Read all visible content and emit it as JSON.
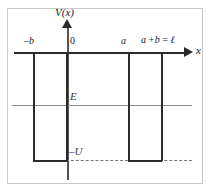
{
  "figure": {
    "axes": {
      "y_label": "V(x)",
      "x_label": "x"
    },
    "tick_labels": {
      "minus_b": "–b",
      "origin": "0",
      "a": "a",
      "period": "a +b = ℓ"
    },
    "levels": {
      "energy_label": "E",
      "depth_label": "–U"
    },
    "colors": {
      "curve": "#2b2b2b",
      "axis": "#2b2b2b",
      "y_axis": "#555555",
      "energy_line": "#8d8d8d",
      "dashed_line": "#777777",
      "frame": "#c9c9c9",
      "background": "#ffffff"
    }
  },
  "chart_data": {
    "type": "line",
    "xlabel": "x",
    "ylabel": "V(x)",
    "xlim": [
      -1.55,
      2.15
    ],
    "ylim": [
      -1.25,
      0.35
    ],
    "grid": false,
    "legend": null,
    "x_tick_values": [
      -1,
      0,
      1,
      1.7
    ],
    "x_tick_labels": [
      "–b",
      "0",
      "a",
      "a +b = ℓ"
    ],
    "annotations": [
      {
        "text": "E",
        "x": 0.03,
        "y": -0.47,
        "kind": "energy-level-label"
      },
      {
        "text": "–U",
        "x": 0.03,
        "y": -0.98,
        "kind": "well-depth-label"
      },
      {
        "text": "V(x)",
        "x": -0.06,
        "y": 0.33,
        "kind": "y-axis-label"
      },
      {
        "text": "x",
        "x": 2.1,
        "y": 0.04,
        "kind": "x-axis-label"
      }
    ],
    "series": [
      {
        "name": "V(x)",
        "comment": "Periodic square wells: V = -U for -b<x<0 and a<x<a+b, V = 0 elsewhere",
        "x": [
          -1.55,
          -1.0,
          -1.0,
          0.0,
          0.0,
          1.0,
          1.0,
          1.7,
          1.7,
          2.0
        ],
        "y": [
          0,
          0,
          -1.0,
          -1.0,
          0,
          0,
          -1.0,
          -1.0,
          0,
          0
        ]
      },
      {
        "name": "E",
        "comment": "Horizontal particle energy level drawn across full frame",
        "style": "solid-thin-gray",
        "x": [
          -1.6,
          2.1
        ],
        "y": [
          -0.5,
          -0.5
        ]
      },
      {
        "name": "-U reference",
        "comment": "Dashed line marking the bottom of the wells",
        "style": "dashed",
        "x": [
          0.0,
          2.1
        ],
        "y": [
          -1.0,
          -1.0
        ]
      }
    ]
  }
}
